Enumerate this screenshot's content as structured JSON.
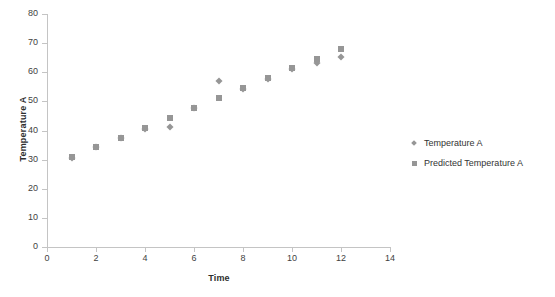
{
  "chart_data": {
    "type": "scatter",
    "title": "",
    "xlabel": "Time",
    "ylabel": "Temperature A",
    "xlim": [
      0,
      14
    ],
    "ylim": [
      0,
      80
    ],
    "xticks": [
      0,
      2,
      4,
      6,
      8,
      10,
      12,
      14
    ],
    "yticks": [
      0,
      10,
      20,
      30,
      40,
      50,
      60,
      70,
      80
    ],
    "grid": false,
    "legend_position": "right",
    "x": [
      1,
      2,
      3,
      4,
      5,
      6,
      7,
      8,
      9,
      10,
      11,
      12
    ],
    "series": [
      {
        "name": "Temperature A",
        "marker": "diamond",
        "color": "#969696",
        "values": [
          30.5,
          34.3,
          37.3,
          40.6,
          41.3,
          47.6,
          57.0,
          54.3,
          57.7,
          61.0,
          63.3,
          65.2
        ]
      },
      {
        "name": "Predicted Temperature A",
        "marker": "square",
        "color": "#969696",
        "values": [
          31.0,
          34.5,
          37.5,
          41.0,
          44.3,
          47.8,
          51.0,
          54.5,
          58.0,
          61.5,
          64.5,
          68.0
        ]
      }
    ]
  },
  "axes": {
    "x_title": "Time",
    "y_title": "Temperature A",
    "x_tick_labels": [
      "0",
      "2",
      "4",
      "6",
      "8",
      "10",
      "12",
      "14"
    ],
    "y_tick_labels": [
      "0",
      "10",
      "20",
      "30",
      "40",
      "50",
      "60",
      "70",
      "80"
    ]
  },
  "legend": {
    "entries": [
      {
        "label": "Temperature A",
        "marker": "diamond"
      },
      {
        "label": "Predicted Temperature A",
        "marker": "square"
      }
    ]
  },
  "colors": {
    "marker": "#969696",
    "axis": "#c4c4c4",
    "text": "#3f3f3f",
    "background": "#ffffff"
  }
}
